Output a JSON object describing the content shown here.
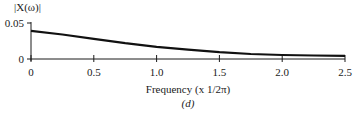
{
  "chart_data": {
    "type": "line",
    "title": "",
    "ylabel": "|X(ω)|",
    "xlabel": "Frequency  (x 1/2π)",
    "caption": "(d)",
    "xlim": [
      0,
      2.5
    ],
    "ylim": [
      0,
      0.05
    ],
    "x_ticks": [
      "0",
      "0.5",
      "1.0",
      "1.5",
      "2.0",
      "2.5"
    ],
    "y_ticks": [
      "0",
      "0.05"
    ],
    "grid": false,
    "legend": null,
    "series": [
      {
        "name": "|X(ω)|",
        "x": [
          0,
          0.25,
          0.5,
          0.75,
          1.0,
          1.25,
          1.5,
          1.75,
          2.0,
          2.25,
          2.5
        ],
        "values": [
          0.039,
          0.034,
          0.028,
          0.022,
          0.017,
          0.013,
          0.0095,
          0.007,
          0.0055,
          0.0048,
          0.0045
        ]
      }
    ]
  }
}
